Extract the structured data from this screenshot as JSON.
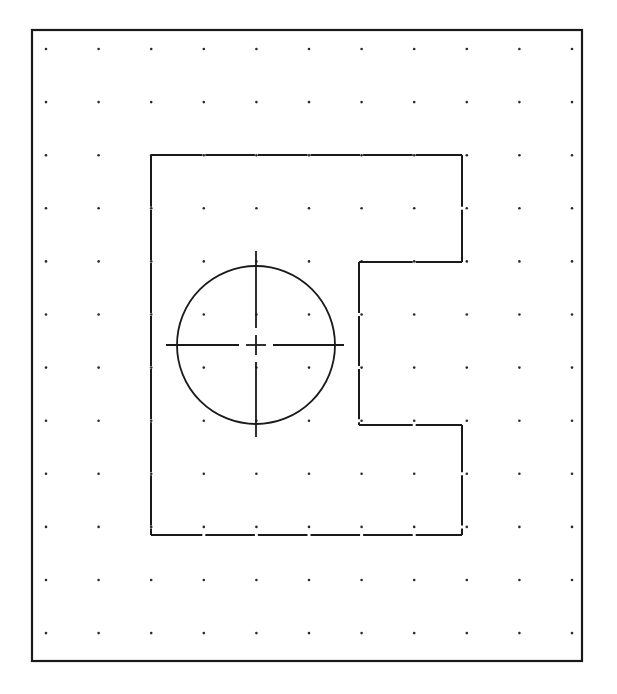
{
  "drawing": {
    "frame": {
      "x": 32,
      "y": 30,
      "width": 550,
      "height": 631
    },
    "grid": {
      "x0": 46,
      "y0": 49,
      "dx": 52.6,
      "dy": 53.1,
      "cols": 11,
      "rows": 12,
      "dot_radius": 1.3
    },
    "part_outline": {
      "points": [
        [
          151,
          155
        ],
        [
          462,
          155
        ],
        [
          462,
          262
        ],
        [
          359,
          262
        ],
        [
          359,
          425
        ],
        [
          462,
          425
        ],
        [
          462,
          535
        ],
        [
          151,
          535
        ]
      ],
      "gap_size": 3
    },
    "hole": {
      "cx": 256,
      "cy": 345,
      "r": 79,
      "centerline_h": {
        "x1": 166,
        "x2": 344
      },
      "centerline_v": {
        "y1": 251,
        "y2": 437
      },
      "center_cross_half": 10,
      "dash_gap": 7
    },
    "colors": {
      "line": "#1a1a1a",
      "dot": "#2a2a2a",
      "background": "#ffffff"
    }
  }
}
